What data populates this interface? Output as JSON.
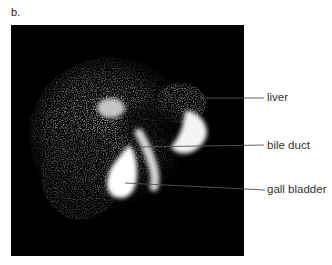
{
  "figure": {
    "panel_label": "b.",
    "image_description": "grayscale scintigraphy (HIDA scan) of liver and biliary tree",
    "annotations": [
      {
        "label": "liver",
        "line_from": [
          200,
          98
        ],
        "line_to": [
          264,
          98
        ],
        "text_x": 267,
        "text_y": 98
      },
      {
        "label": "bile duct",
        "line_from": [
          140,
          147
        ],
        "line_to": [
          264,
          145
        ],
        "text_x": 267,
        "text_y": 146
      },
      {
        "label": "gall bladder",
        "line_from": [
          125,
          183
        ],
        "line_to": [
          265,
          190
        ],
        "text_x": 267,
        "text_y": 190
      }
    ]
  }
}
